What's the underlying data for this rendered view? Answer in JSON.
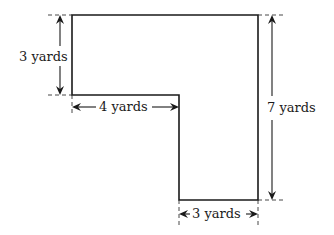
{
  "diagram": {
    "type": "L-shaped region with dimensions",
    "unit": "yards",
    "dimensions": [
      {
        "id": "left_height",
        "value": 3,
        "label": "3 yards",
        "orientation": "vertical"
      },
      {
        "id": "top_notch_width",
        "value": 4,
        "label": "4 yards",
        "orientation": "horizontal"
      },
      {
        "id": "total_height",
        "value": 7,
        "label": "7 yards",
        "orientation": "vertical"
      },
      {
        "id": "bottom_width",
        "value": 3,
        "label": "3 yards",
        "orientation": "horizontal"
      }
    ]
  }
}
